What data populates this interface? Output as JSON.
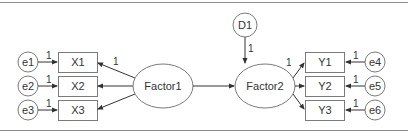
{
  "diagram": {
    "type": "structural-equation-model",
    "colors": {
      "stroke": "#7a7a7a",
      "text": "#333333",
      "border": "#8c8c8c",
      "background": "#ffffff"
    },
    "latent": [
      {
        "id": "Factor1",
        "label": "Factor1"
      },
      {
        "id": "Factor2",
        "label": "Factor2"
      }
    ],
    "disturbance": {
      "id": "D1",
      "label": "D1",
      "path_label": "1"
    },
    "observed_left": [
      {
        "id": "X1",
        "label": "X1",
        "error": "e1",
        "error_label": "e1",
        "error_path_label": "1"
      },
      {
        "id": "X2",
        "label": "X2",
        "error": "e2",
        "error_label": "e2",
        "error_path_label": "1"
      },
      {
        "id": "X3",
        "label": "X3",
        "error": "e3",
        "error_label": "e3",
        "error_path_label": "1"
      }
    ],
    "observed_right": [
      {
        "id": "Y1",
        "label": "Y1",
        "error": "e4",
        "error_label": "e4",
        "error_path_label": "1"
      },
      {
        "id": "Y2",
        "label": "Y2",
        "error": "e5",
        "error_label": "e5",
        "error_path_label": "1"
      },
      {
        "id": "Y3",
        "label": "Y3",
        "error": "e6",
        "error_label": "e6",
        "error_path_label": "1"
      }
    ],
    "loadings": {
      "Factor1_X1": "1",
      "Factor2_Y1": "1"
    },
    "structural_paths": [
      {
        "from": "Factor1",
        "to": "Factor2"
      },
      {
        "from": "D1",
        "to": "Factor2"
      }
    ]
  }
}
